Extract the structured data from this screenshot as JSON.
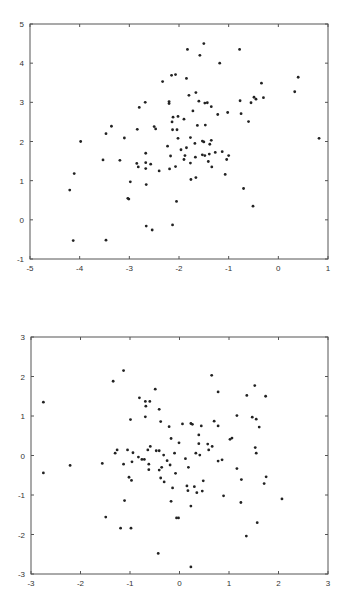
{
  "chart_data": [
    {
      "type": "scatter",
      "title": "",
      "xlabel": "",
      "ylabel": "",
      "xlim": [
        -5,
        1
      ],
      "ylim": [
        -1,
        5
      ],
      "grid": false,
      "legend": null,
      "x_ticks": [
        "-5",
        "-4",
        "-3",
        "-2",
        "-1",
        "0",
        "1"
      ],
      "y_ticks": [
        "-1",
        "0",
        "1",
        "2",
        "3",
        "4",
        "5"
      ],
      "marker_color": "#222222",
      "points": [
        [
          -1.83,
          4.35
        ],
        [
          -1.5,
          4.5
        ],
        [
          -1.58,
          4.2
        ],
        [
          -0.78,
          4.35
        ],
        [
          -1.18,
          4.0
        ],
        [
          -2.33,
          3.53
        ],
        [
          -2.15,
          3.69
        ],
        [
          -2.07,
          3.71
        ],
        [
          -1.85,
          3.61
        ],
        [
          0.4,
          3.64
        ],
        [
          -0.34,
          3.49
        ],
        [
          0.33,
          3.27
        ],
        [
          -1.66,
          3.25
        ],
        [
          -1.8,
          3.18
        ],
        [
          -2.68,
          3.0
        ],
        [
          -2.2,
          3.02
        ],
        [
          -2.2,
          2.97
        ],
        [
          -1.6,
          3.03
        ],
        [
          -1.48,
          2.98
        ],
        [
          -1.43,
          2.99
        ],
        [
          -0.77,
          3.04
        ],
        [
          -0.49,
          3.13
        ],
        [
          -0.3,
          3.12
        ],
        [
          -0.45,
          3.08
        ],
        [
          -0.55,
          2.99
        ],
        [
          -2.8,
          2.87
        ],
        [
          -1.35,
          2.89
        ],
        [
          -1.72,
          2.78
        ],
        [
          -1.02,
          2.74
        ],
        [
          -0.75,
          2.71
        ],
        [
          -1.22,
          2.69
        ],
        [
          -2.12,
          2.62
        ],
        [
          -2.02,
          2.64
        ],
        [
          -1.9,
          2.57
        ],
        [
          -0.6,
          2.51
        ],
        [
          -2.14,
          2.5
        ],
        [
          -1.63,
          2.41
        ],
        [
          -1.47,
          2.42
        ],
        [
          -3.36,
          2.39
        ],
        [
          -2.5,
          2.38
        ],
        [
          -2.47,
          2.32
        ],
        [
          -2.84,
          2.31
        ],
        [
          -2.13,
          2.3
        ],
        [
          -2.04,
          2.3
        ],
        [
          -3.47,
          2.2
        ],
        [
          -3.1,
          2.09
        ],
        [
          -1.77,
          2.1
        ],
        [
          -2.02,
          2.08
        ],
        [
          -3.98,
          2.0
        ],
        [
          -1.53,
          2.01
        ],
        [
          -1.5,
          1.99
        ],
        [
          -1.35,
          2.03
        ],
        [
          -1.68,
          1.95
        ],
        [
          -1.38,
          1.93
        ],
        [
          -2.23,
          1.88
        ],
        [
          -1.85,
          1.84
        ],
        [
          -1.96,
          1.79
        ],
        [
          -2.67,
          1.7
        ],
        [
          -1.13,
          1.74
        ],
        [
          -1.27,
          1.72
        ],
        [
          -1.0,
          1.64
        ],
        [
          -2.17,
          1.63
        ],
        [
          -1.88,
          1.64
        ],
        [
          -1.53,
          1.66
        ],
        [
          -1.48,
          1.64
        ],
        [
          -1.39,
          1.68
        ],
        [
          -1.67,
          1.6
        ],
        [
          -1.04,
          1.54
        ],
        [
          -3.53,
          1.53
        ],
        [
          -3.19,
          1.52
        ],
        [
          -1.9,
          1.54
        ],
        [
          -1.41,
          1.49
        ],
        [
          -2.85,
          1.44
        ],
        [
          -2.67,
          1.46
        ],
        [
          -2.57,
          1.42
        ],
        [
          -1.77,
          1.45
        ],
        [
          -2.82,
          1.35
        ],
        [
          -2.67,
          1.31
        ],
        [
          -2.07,
          1.36
        ],
        [
          -1.34,
          1.35
        ],
        [
          -2.4,
          1.25
        ],
        [
          -2.19,
          1.3
        ],
        [
          -4.11,
          1.18
        ],
        [
          -1.07,
          1.16
        ],
        [
          -1.66,
          1.08
        ],
        [
          -1.76,
          1.03
        ],
        [
          -2.98,
          0.97
        ],
        [
          -2.66,
          0.9
        ],
        [
          -4.2,
          0.76
        ],
        [
          -0.7,
          0.8
        ],
        [
          -3.03,
          0.55
        ],
        [
          -3.01,
          0.53
        ],
        [
          -2.05,
          0.47
        ],
        [
          -0.51,
          0.35
        ],
        [
          0.82,
          2.08
        ],
        [
          -2.66,
          -0.16
        ],
        [
          -2.54,
          -0.26
        ],
        [
          -2.13,
          -0.13
        ],
        [
          -4.13,
          -0.53
        ],
        [
          -3.47,
          -0.52
        ]
      ]
    },
    {
      "type": "scatter",
      "title": "",
      "xlabel": "",
      "ylabel": "",
      "xlim": [
        -3,
        3
      ],
      "ylim": [
        -3,
        3
      ],
      "grid": false,
      "legend": null,
      "x_ticks": [
        "-3",
        "-2",
        "-1",
        "0",
        "1",
        "2",
        "3"
      ],
      "y_ticks": [
        "-3",
        "-2",
        "-1",
        "0",
        "1",
        "2",
        "3"
      ],
      "marker_color": "#222222",
      "points": [
        [
          -1.13,
          2.15
        ],
        [
          -1.34,
          1.88
        ],
        [
          0.65,
          2.03
        ],
        [
          1.52,
          1.77
        ],
        [
          -0.49,
          1.68
        ],
        [
          0.78,
          1.61
        ],
        [
          1.36,
          1.52
        ],
        [
          1.74,
          1.5
        ],
        [
          -0.81,
          1.46
        ],
        [
          -2.75,
          1.35
        ],
        [
          -0.69,
          1.37
        ],
        [
          -0.6,
          1.37
        ],
        [
          -0.68,
          1.25
        ],
        [
          -0.41,
          1.17
        ],
        [
          1.16,
          1.01
        ],
        [
          -0.69,
          0.98
        ],
        [
          1.47,
          0.97
        ],
        [
          -0.99,
          0.91
        ],
        [
          1.55,
          0.92
        ],
        [
          0.7,
          0.87
        ],
        [
          -0.38,
          0.86
        ],
        [
          0.06,
          0.8
        ],
        [
          0.23,
          0.81
        ],
        [
          0.26,
          0.79
        ],
        [
          0.44,
          0.75
        ],
        [
          0.78,
          0.75
        ],
        [
          -0.21,
          0.73
        ],
        [
          1.61,
          0.72
        ],
        [
          0.39,
          0.52
        ],
        [
          1.06,
          0.44
        ],
        [
          1.02,
          0.41
        ],
        [
          -0.17,
          0.43
        ],
        [
          -0.01,
          0.32
        ],
        [
          0.39,
          0.3
        ],
        [
          0.57,
          0.29
        ],
        [
          0.66,
          0.23
        ],
        [
          -0.59,
          0.23
        ],
        [
          1.53,
          0.2
        ],
        [
          -1.26,
          0.14
        ],
        [
          -1.05,
          0.14
        ],
        [
          -0.64,
          0.14
        ],
        [
          -0.47,
          0.12
        ],
        [
          -0.41,
          0.12
        ],
        [
          0.59,
          0.14
        ],
        [
          -1.3,
          0.06
        ],
        [
          -0.94,
          0.07
        ],
        [
          -0.1,
          0.06
        ],
        [
          0.33,
          0.06
        ],
        [
          1.55,
          0.06
        ],
        [
          0.41,
          0.01
        ],
        [
          -0.32,
          0.01
        ],
        [
          -0.83,
          -0.04
        ],
        [
          -0.76,
          -0.1
        ],
        [
          -0.71,
          -0.1
        ],
        [
          0.12,
          -0.08
        ],
        [
          -0.25,
          -0.13
        ],
        [
          0.78,
          -0.14
        ],
        [
          0.86,
          -0.11
        ],
        [
          -1.56,
          -0.2
        ],
        [
          -0.96,
          -0.16
        ],
        [
          -0.62,
          -0.22
        ],
        [
          -1.13,
          -0.22
        ],
        [
          -0.19,
          -0.24
        ],
        [
          -2.21,
          -0.25
        ],
        [
          -0.36,
          -0.3
        ],
        [
          0.18,
          -0.3
        ],
        [
          1.16,
          -0.33
        ],
        [
          -0.62,
          -0.36
        ],
        [
          -0.41,
          -0.37
        ],
        [
          -2.75,
          -0.44
        ],
        [
          -0.08,
          -0.45
        ],
        [
          -1.02,
          -0.55
        ],
        [
          -0.38,
          -0.57
        ],
        [
          1.75,
          -0.54
        ],
        [
          -0.97,
          -0.63
        ],
        [
          1.25,
          -0.61
        ],
        [
          0.48,
          -0.64
        ],
        [
          -0.31,
          -0.67
        ],
        [
          1.71,
          -0.71
        ],
        [
          0.15,
          -0.77
        ],
        [
          0.3,
          -0.79
        ],
        [
          -0.14,
          -0.82
        ],
        [
          0.17,
          -0.89
        ],
        [
          0.46,
          -0.9
        ],
        [
          0.35,
          -0.94
        ],
        [
          0.89,
          -1.02
        ],
        [
          2.07,
          -1.1
        ],
        [
          -1.11,
          -1.14
        ],
        [
          -0.17,
          -1.16
        ],
        [
          1.24,
          -1.19
        ],
        [
          0.23,
          -1.28
        ],
        [
          -1.49,
          -1.56
        ],
        [
          -0.06,
          -1.58
        ],
        [
          -0.02,
          -1.58
        ],
        [
          1.57,
          -1.7
        ],
        [
          -1.19,
          -1.84
        ],
        [
          -0.98,
          -1.84
        ],
        [
          1.35,
          -2.04
        ],
        [
          -0.43,
          -2.48
        ],
        [
          0.23,
          -2.82
        ]
      ]
    }
  ]
}
